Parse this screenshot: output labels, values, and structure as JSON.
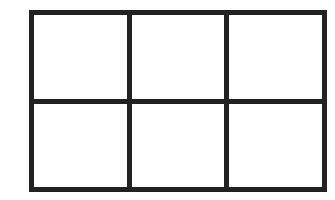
{
  "diagram": {
    "type": "grid",
    "rows": 2,
    "columns": 3,
    "line_color": "#222222",
    "background_color": "#ffffff",
    "cells": [
      {
        "row": 1,
        "col": 1,
        "label": ""
      },
      {
        "row": 1,
        "col": 2,
        "label": ""
      },
      {
        "row": 1,
        "col": 3,
        "label": ""
      },
      {
        "row": 2,
        "col": 1,
        "label": ""
      },
      {
        "row": 2,
        "col": 2,
        "label": ""
      },
      {
        "row": 2,
        "col": 3,
        "label": ""
      }
    ]
  }
}
